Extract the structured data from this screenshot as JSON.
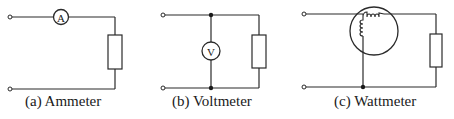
{
  "figure": {
    "panels": [
      {
        "id": "a",
        "caption": "(a) Ammeter",
        "meter_symbol": "A",
        "meter_connection": "series"
      },
      {
        "id": "b",
        "caption": "(b) Voltmeter",
        "meter_symbol": "V",
        "meter_connection": "parallel"
      },
      {
        "id": "c",
        "caption": "(c) Wattmeter",
        "meter_symbol": "coils",
        "meter_connection": "current coil in series, voltage coil across supply"
      }
    ]
  },
  "colors": {
    "ink": "#2a2a2a",
    "background": "#ffffff"
  }
}
